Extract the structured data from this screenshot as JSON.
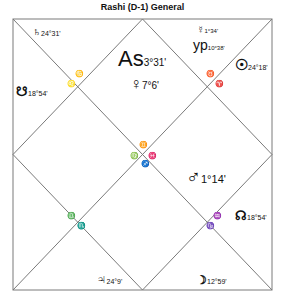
{
  "title": "Rashi (D-1) General",
  "colors": {
    "line": "#7a7a7a",
    "text": "#111111"
  },
  "houses": {
    "h1": {
      "planets": [
        {
          "symbol": "As",
          "name": "ascendant",
          "degree": "3°31'"
        },
        {
          "symbol": "♀",
          "name": "venus",
          "degree": "7°6'"
        }
      ],
      "sign_symbol": "♊"
    },
    "h2": {
      "planets": [
        {
          "symbol": "☿",
          "name": "mercury",
          "degree": "1°34'"
        },
        {
          "symbol": "yp",
          "name": "yogi-point",
          "degree": "10°38'"
        }
      ],
      "sign_symbol": "♉"
    },
    "h3": {
      "planets": [
        {
          "symbol": "☉",
          "name": "sun",
          "degree": "24°18'"
        }
      ],
      "sign_symbol": "♈"
    },
    "h4": {
      "planets": [
        {
          "symbol": "♂",
          "name": "mars",
          "degree": "1°14'"
        }
      ],
      "sign_symbol": "♓"
    },
    "h5": {
      "planets": [
        {
          "symbol": "☊",
          "name": "rahu",
          "degree": "18°54'"
        }
      ],
      "sign_symbol": "♒"
    },
    "h6": {
      "planets": [
        {
          "symbol": "☽",
          "name": "moon",
          "degree": "12°59'"
        }
      ],
      "sign_symbol": "♑"
    },
    "h7": {
      "planets": [],
      "sign_symbol": "♐"
    },
    "h8": {
      "planets": [
        {
          "symbol": "♃",
          "name": "jupiter",
          "degree": "24°9'"
        }
      ],
      "sign_symbol": "♏"
    },
    "h9": {
      "planets": [],
      "sign_symbol": "♎"
    },
    "h10": {
      "planets": [],
      "sign_symbol": "♍"
    },
    "h11": {
      "planets": [
        {
          "symbol": "☋",
          "name": "ketu",
          "degree": "18°54'"
        }
      ],
      "sign_symbol": "♌"
    },
    "h12": {
      "planets": [
        {
          "symbol": "♄",
          "name": "saturn",
          "degree": "24°31'"
        }
      ],
      "sign_symbol": "♋"
    }
  }
}
